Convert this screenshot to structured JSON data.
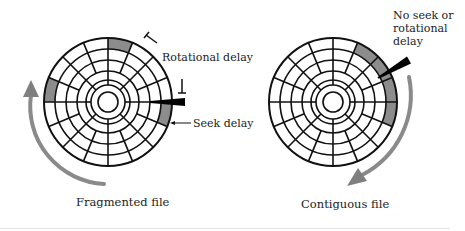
{
  "colors": {
    "stroke": "#111111",
    "sector_fill": "#8c8c8c",
    "arrow": "#8a8a8a",
    "head": "#000000"
  },
  "disks": [
    {
      "name": "fragmented",
      "cx": 108,
      "cy": 102,
      "ring_radii": [
        64,
        53,
        42,
        31,
        22
      ],
      "hub_radii": [
        17,
        10
      ],
      "sector_count": 16,
      "shaded_sectors": [
        {
          "ring_outer": 64,
          "ring_inner": 53,
          "start_deg": -90,
          "end_deg": -67.5
        },
        {
          "ring_outer": 64,
          "ring_inner": 53,
          "start_deg": 180,
          "end_deg": 202.5
        },
        {
          "ring_outer": 64,
          "ring_inner": 53,
          "start_deg": 0,
          "end_deg": 22.5
        }
      ],
      "head": {
        "x1": 150,
        "y1": 102,
        "x2": 185,
        "y2": 102,
        "w_start": 2,
        "w_end": 8
      },
      "rotation_arrow": {
        "direction": "counterclockwise"
      }
    },
    {
      "name": "contiguous",
      "cx": 333,
      "cy": 102,
      "ring_radii": [
        64,
        53,
        42,
        31,
        22
      ],
      "hub_radii": [
        17,
        10
      ],
      "sector_count": 16,
      "shaded_sectors": [
        {
          "ring_outer": 64,
          "ring_inner": 53,
          "start_deg": -67.5,
          "end_deg": -45
        },
        {
          "ring_outer": 64,
          "ring_inner": 53,
          "start_deg": -45,
          "end_deg": -22.5
        },
        {
          "ring_outer": 64,
          "ring_inner": 53,
          "start_deg": -22.5,
          "end_deg": 0
        },
        {
          "ring_outer": 64,
          "ring_inner": 53,
          "start_deg": 0,
          "end_deg": 22.5
        }
      ],
      "head": {
        "x1": 378,
        "y1": 78,
        "x2": 409,
        "y2": 60,
        "w_start": 2,
        "w_end": 8
      },
      "rotation_arrow": {
        "direction": "clockwise"
      }
    }
  ],
  "labels": {
    "rotational_delay": "Rotational delay",
    "seek_delay": "Seek delay",
    "no_seek_line1": "No seek or",
    "no_seek_line2": "rotational",
    "no_seek_line3": "delay",
    "fragmented_caption": "Fragmented file",
    "contiguous_caption": "Contiguous file"
  }
}
